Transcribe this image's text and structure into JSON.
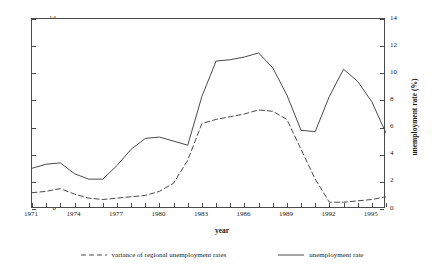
{
  "chart_data": {
    "type": "line",
    "title": "",
    "xlabel": "year",
    "ylabel": "variance",
    "ylabel_right": "unemployment rate (%)",
    "xlim": [
      1971,
      1996
    ],
    "ylim": [
      0,
      14
    ],
    "ylim_right": [
      0,
      14
    ],
    "grid": false,
    "legend_position": "bottom",
    "y_ticks": [
      0,
      2,
      4,
      6,
      8,
      10,
      12,
      14
    ],
    "y_ticks_right": [
      0,
      2,
      4,
      6,
      8,
      10,
      12,
      14
    ],
    "x_ticks": [
      1971,
      1974,
      1977,
      1980,
      1983,
      1986,
      1989,
      1992,
      1995
    ],
    "x_minor_ticks": [
      1971,
      1972,
      1973,
      1974,
      1975,
      1976,
      1977,
      1978,
      1979,
      1980,
      1981,
      1982,
      1983,
      1984,
      1985,
      1986,
      1987,
      1988,
      1989,
      1990,
      1991,
      1992,
      1993,
      1994,
      1995,
      1996
    ],
    "x": [
      1971,
      1972,
      1973,
      1974,
      1975,
      1976,
      1977,
      1978,
      1979,
      1980,
      1981,
      1982,
      1983,
      1984,
      1985,
      1986,
      1987,
      1988,
      1989,
      1990,
      1991,
      1992,
      1993,
      1994,
      1995,
      1996
    ],
    "series": [
      {
        "name": "variance of regional unemployment rates",
        "style": "dashed",
        "axis": "left",
        "color": "#4a4a4a",
        "values": [
          1.2,
          1.3,
          1.5,
          1.1,
          0.8,
          0.7,
          0.8,
          0.9,
          1.0,
          1.3,
          1.9,
          3.6,
          6.3,
          6.6,
          6.8,
          7.0,
          7.3,
          7.2,
          6.6,
          4.4,
          2.2,
          0.5,
          0.5,
          0.6,
          0.7,
          0.9
        ]
      },
      {
        "name": "unemployment rate",
        "style": "solid",
        "axis": "right",
        "color": "#4a4a4a",
        "values": [
          3.0,
          3.3,
          3.4,
          2.6,
          2.2,
          2.2,
          3.2,
          4.4,
          5.2,
          5.3,
          5.0,
          4.7,
          8.3,
          10.9,
          11.0,
          11.2,
          11.5,
          10.4,
          8.4,
          5.8,
          5.7,
          8.3,
          10.3,
          9.4,
          7.9,
          5.6
        ]
      }
    ],
    "legend": [
      {
        "label": "variance of regional unemployment rates",
        "style": "dashed"
      },
      {
        "label": "unemployment rate",
        "style": "solid"
      }
    ]
  }
}
